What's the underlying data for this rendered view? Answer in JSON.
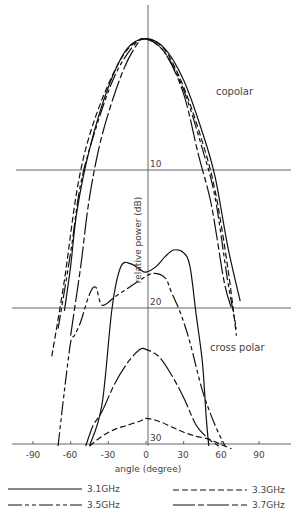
{
  "chart_data": {
    "type": "line",
    "title": "",
    "xlabel": "angle (degree)",
    "ylabel": "relative power (dB)",
    "x_ticks": [
      -90,
      -60,
      -30,
      0,
      30,
      60,
      90
    ],
    "y_ticks": [
      10,
      20,
      30
    ],
    "xlim": [
      -100,
      110
    ],
    "ylim": [
      0,
      30
    ],
    "y_inverted": true,
    "grid": "horizontal reference lines at 10 and 20 dB",
    "legend_position": "bottom",
    "annotations": [
      "copolar",
      "cross polar"
    ],
    "series": [
      {
        "name": "3.1GHz",
        "style": "solid",
        "group": "copolar",
        "points": [
          [
            -65,
            20.2
          ],
          [
            -60,
            17
          ],
          [
            -55,
            13
          ],
          [
            -45,
            8.5
          ],
          [
            -30,
            4
          ],
          [
            -15,
            1.2
          ],
          [
            0,
            0.5
          ],
          [
            15,
            1.2
          ],
          [
            30,
            3.5
          ],
          [
            45,
            7.3
          ],
          [
            55,
            10.5
          ],
          [
            65,
            15.5
          ],
          [
            75,
            19.5
          ]
        ]
      },
      {
        "name": "3.3GHz",
        "style": "dashed",
        "group": "copolar",
        "points": [
          [
            -75,
            23.5
          ],
          [
            -65,
            18
          ],
          [
            -55,
            11.5
          ],
          [
            -45,
            7.5
          ],
          [
            -30,
            3.8
          ],
          [
            -15,
            1.3
          ],
          [
            0,
            0.5
          ],
          [
            15,
            1.3
          ],
          [
            30,
            4
          ],
          [
            45,
            8
          ],
          [
            55,
            11.5
          ],
          [
            65,
            17
          ],
          [
            72,
            22
          ]
        ]
      },
      {
        "name": "3.5GHz",
        "style": "dash-dot",
        "group": "copolar",
        "points": [
          [
            -70,
            21.5
          ],
          [
            -60,
            16
          ],
          [
            -52,
            11
          ],
          [
            -40,
            7
          ],
          [
            -25,
            3.2
          ],
          [
            -10,
            1
          ],
          [
            0,
            0.5
          ],
          [
            15,
            1.5
          ],
          [
            30,
            4.2
          ],
          [
            45,
            8.5
          ],
          [
            55,
            12
          ],
          [
            65,
            18
          ],
          [
            72,
            21.5
          ]
        ]
      },
      {
        "name": "3.7GHz",
        "style": "long-dash-short-dash",
        "group": "copolar",
        "points": [
          [
            -60,
            22
          ],
          [
            -52,
            17
          ],
          [
            -45,
            12
          ],
          [
            -35,
            7.5
          ],
          [
            -20,
            3.2
          ],
          [
            -8,
            1
          ],
          [
            0,
            0.5
          ],
          [
            15,
            1.5
          ],
          [
            30,
            4.5
          ],
          [
            42,
            9
          ],
          [
            52,
            12.5
          ],
          [
            62,
            18
          ],
          [
            68,
            20
          ]
        ]
      },
      {
        "name": "3.1GHz",
        "style": "solid",
        "group": "cross polar",
        "points": [
          [
            -45,
            30
          ],
          [
            -35,
            27
          ],
          [
            -27,
            20
          ],
          [
            -20,
            17
          ],
          [
            -12,
            16.8
          ],
          [
            -5,
            17.2
          ],
          [
            0,
            17.4
          ],
          [
            8,
            17
          ],
          [
            15,
            16.3
          ],
          [
            22,
            15.8
          ],
          [
            30,
            16
          ],
          [
            35,
            17
          ],
          [
            40,
            20.5
          ],
          [
            45,
            24
          ],
          [
            48,
            28
          ],
          [
            50,
            30
          ]
        ]
      },
      {
        "name": "3.3GHz",
        "style": "dashed",
        "group": "cross polar",
        "points": [
          [
            -45,
            30
          ],
          [
            -35,
            29.3
          ],
          [
            -25,
            28.8
          ],
          [
            -15,
            28.5
          ],
          [
            -5,
            28.2
          ],
          [
            0,
            28
          ],
          [
            10,
            28.2
          ],
          [
            20,
            28.6
          ],
          [
            30,
            29
          ],
          [
            40,
            29.3
          ],
          [
            50,
            29.5
          ],
          [
            60,
            29.9
          ],
          [
            68,
            30.2
          ]
        ]
      },
      {
        "name": "3.5GHz",
        "style": "dash-dot",
        "group": "cross polar",
        "points": [
          [
            -70,
            30
          ],
          [
            -65,
            26
          ],
          [
            -60,
            22.5
          ],
          [
            -57,
            22
          ],
          [
            -52,
            21
          ],
          [
            -45,
            19
          ],
          [
            -40,
            18.5
          ],
          [
            -35,
            19.8
          ],
          [
            -25,
            19.2
          ],
          [
            -15,
            18.6
          ],
          [
            -5,
            18
          ],
          [
            5,
            17.5
          ],
          [
            15,
            17.8
          ],
          [
            20,
            18.8
          ],
          [
            28,
            20.5
          ],
          [
            35,
            22.5
          ],
          [
            45,
            26
          ],
          [
            55,
            28.5
          ],
          [
            63,
            30
          ]
        ]
      },
      {
        "name": "3.7GHz",
        "style": "long-dash-short-dash",
        "group": "cross polar",
        "points": [
          [
            -48,
            30
          ],
          [
            -42,
            28.5
          ],
          [
            -35,
            27.5
          ],
          [
            -25,
            25.5
          ],
          [
            -15,
            24
          ],
          [
            -5,
            23
          ],
          [
            0,
            23
          ],
          [
            10,
            23.5
          ],
          [
            20,
            24.8
          ],
          [
            30,
            26.5
          ],
          [
            40,
            28.5
          ],
          [
            50,
            29.5
          ],
          [
            58,
            30
          ]
        ]
      }
    ]
  },
  "labels": {
    "copolar": "copolar",
    "cross_polar": "cross polar",
    "xlabel": "angle (degree)",
    "ylabel": "relative power (dB)",
    "y10": "10",
    "y20": "20",
    "y30": "30",
    "xt0": "-90",
    "xt1": "-60",
    "xt2": "-30",
    "xt3": "0",
    "xt4": "30",
    "xt5": "60",
    "xt6": "90"
  },
  "legend": [
    {
      "label": "3.1GHz",
      "style": "solid"
    },
    {
      "label": "3.3GHz",
      "style": "dashed"
    },
    {
      "label": "3.5GHz",
      "style": "dash-dot"
    },
    {
      "label": "3.7GHz",
      "style": "long-dash-short-dash"
    }
  ]
}
